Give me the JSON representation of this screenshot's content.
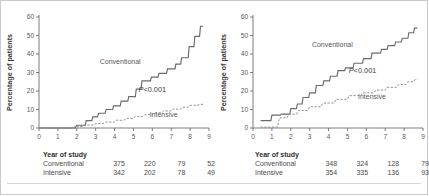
{
  "figure": {
    "background": "#ffffff",
    "border_color": "#c9c9cb",
    "axis_color": "#6e6e70",
    "conventional_color": "#6b6b6d",
    "intensive_color": "#8d8d90"
  },
  "panels": [
    {
      "id": "panel-left",
      "chart_data": {
        "type": "line",
        "title": "",
        "xlabel": "",
        "ylabel": "Percentage of patients",
        "xlim": [
          0,
          9
        ],
        "ylim": [
          0,
          60
        ],
        "xticks": [
          0,
          1,
          2,
          3,
          4,
          5,
          6,
          7,
          8,
          9
        ],
        "yticks": [
          0,
          10,
          20,
          30,
          40,
          50,
          60
        ],
        "grid": false,
        "legend_position": "inline-annotation",
        "annotations": [
          {
            "text": "Conventional",
            "x": 4.3,
            "y": 34.5
          },
          {
            "text": "Intensive",
            "x": 6.6,
            "y": 6.0
          },
          {
            "text": "P<0.001",
            "x": 6.0,
            "y": 19.5
          }
        ],
        "series": [
          {
            "name": "Conventional",
            "style": "step-solid",
            "x": [
              0,
              1.9,
              2.0,
              2.45,
              2.5,
              2.8,
              2.85,
              3.1,
              3.15,
              3.5,
              3.55,
              3.9,
              3.95,
              4.3,
              4.35,
              4.7,
              4.75,
              5.1,
              5.15,
              5.4,
              5.45,
              5.9,
              5.95,
              6.3,
              6.35,
              6.75,
              6.8,
              7.2,
              7.25,
              7.5,
              7.55,
              7.9,
              7.95,
              8.2,
              8.25,
              8.5,
              8.55,
              8.7
            ],
            "y": [
              0,
              0,
              1.5,
              1.5,
              4.0,
              4.0,
              6.0,
              6.0,
              8.0,
              8.0,
              10.0,
              10.0,
              12.0,
              12.0,
              14.5,
              14.5,
              17.0,
              17.0,
              21.0,
              21.0,
              25.5,
              25.5,
              27.5,
              27.5,
              29.5,
              29.5,
              32.0,
              32.0,
              34.5,
              34.5,
              38.0,
              38.0,
              44.0,
              44.0,
              49.5,
              49.5,
              55.0,
              55.0
            ]
          },
          {
            "name": "Intensive",
            "style": "step-dashed",
            "x": [
              0,
              1.8,
              1.9,
              2.3,
              2.4,
              2.9,
              3.0,
              3.4,
              3.5,
              4.0,
              4.1,
              4.5,
              4.6,
              5.0,
              5.1,
              5.5,
              5.6,
              6.0,
              6.1,
              6.5,
              6.6,
              7.0,
              7.1,
              7.5,
              7.6,
              7.9,
              8.0,
              8.4,
              8.5,
              8.7
            ],
            "y": [
              0,
              0,
              0.8,
              0.8,
              1.6,
              1.6,
              2.4,
              2.4,
              3.2,
              3.2,
              4.2,
              4.2,
              5.2,
              5.2,
              6.2,
              6.2,
              7.2,
              7.2,
              8.2,
              8.2,
              9.2,
              9.2,
              10.2,
              10.2,
              11.2,
              11.2,
              12.3,
              12.3,
              12.8,
              12.8
            ]
          }
        ]
      },
      "table": {
        "header": "Year of study",
        "rows": [
          {
            "label": "Conventional",
            "values": [
              "375",
              "220",
              "79",
              "52"
            ]
          },
          {
            "label": "Intensive",
            "values": [
              "342",
              "202",
              "78",
              "49"
            ]
          }
        ]
      }
    },
    {
      "id": "panel-right",
      "chart_data": {
        "type": "line",
        "title": "",
        "xlabel": "",
        "ylabel": "Percentage of patients",
        "xlim": [
          0,
          9
        ],
        "ylim": [
          0,
          60
        ],
        "xticks": [
          0,
          1,
          2,
          3,
          4,
          5,
          6,
          7,
          8,
          9
        ],
        "yticks": [
          0,
          10,
          20,
          30,
          40,
          50,
          60
        ],
        "grid": false,
        "legend_position": "inline-annotation",
        "annotations": [
          {
            "text": "Conventional",
            "x": 4.2,
            "y": 44.0
          },
          {
            "text": "Intensive",
            "x": 6.3,
            "y": 15.5
          },
          {
            "text": "P<0.001",
            "x": 5.8,
            "y": 30.0
          }
        ],
        "series": [
          {
            "name": "Conventional",
            "style": "step-solid",
            "x": [
              0.4,
              0.95,
              1.0,
              1.45,
              1.5,
              1.95,
              2.0,
              2.3,
              2.35,
              2.6,
              2.65,
              2.95,
              3.0,
              3.3,
              3.35,
              3.7,
              3.75,
              4.05,
              4.1,
              4.45,
              4.5,
              4.85,
              4.9,
              5.3,
              5.35,
              5.8,
              5.85,
              6.25,
              6.3,
              6.75,
              6.8,
              7.1,
              7.15,
              7.5,
              7.55,
              7.85,
              7.9,
              8.2,
              8.25,
              8.5,
              8.55,
              8.7
            ],
            "y": [
              4.0,
              4.0,
              7.0,
              7.0,
              7.5,
              7.5,
              10.5,
              10.5,
              13.0,
              13.0,
              16.5,
              16.5,
              19.0,
              19.0,
              23.0,
              23.0,
              25.5,
              25.5,
              28.0,
              28.0,
              31.0,
              31.0,
              32.5,
              32.5,
              35.0,
              35.0,
              37.5,
              37.5,
              40.5,
              40.5,
              42.5,
              42.5,
              44.5,
              44.5,
              46.5,
              46.5,
              48.5,
              48.5,
              51.5,
              51.5,
              54.0,
              54.0
            ]
          },
          {
            "name": "Intensive",
            "style": "step-dashed",
            "x": [
              0.4,
              1.3,
              1.4,
              1.8,
              1.9,
              2.3,
              2.4,
              2.9,
              3.0,
              3.6,
              3.7,
              4.3,
              4.4,
              5.0,
              5.1,
              5.7,
              5.8,
              6.4,
              6.5,
              7.0,
              7.1,
              7.6,
              7.7,
              8.1,
              8.2,
              8.5,
              8.6,
              8.7
            ],
            "y": [
              0.5,
              0.5,
              5.5,
              5.5,
              7.5,
              7.5,
              9.5,
              9.5,
              11.5,
              11.5,
              13.5,
              13.5,
              15.5,
              15.5,
              17.5,
              17.5,
              19.0,
              19.0,
              20.5,
              20.5,
              22.0,
              22.0,
              23.5,
              23.5,
              25.0,
              25.0,
              26.5,
              26.5
            ]
          }
        ]
      },
      "table": {
        "header": "Year of study",
        "rows": [
          {
            "label": "Conventional",
            "values": [
              "348",
              "324",
              "128",
              "79"
            ]
          },
          {
            "label": "Intensive",
            "values": [
              "354",
              "335",
              "136",
              "93"
            ]
          }
        ]
      }
    }
  ]
}
